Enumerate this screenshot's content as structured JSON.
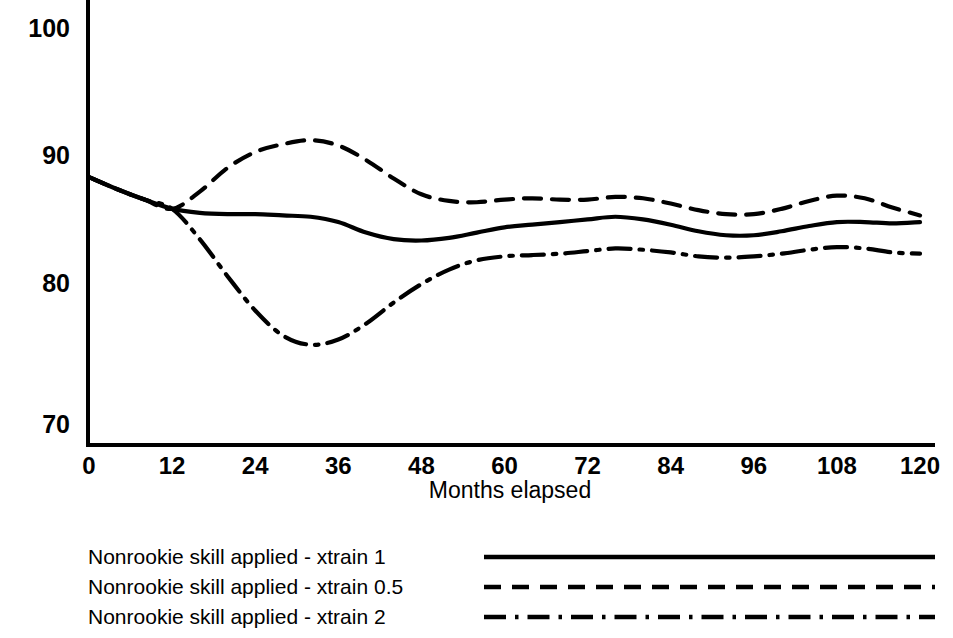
{
  "chart_data": {
    "type": "line",
    "title": "",
    "xlabel": "Months elapsed",
    "ylabel": "",
    "xlim": [
      0,
      120
    ],
    "ylim": [
      70,
      100
    ],
    "grid": false,
    "legend_position": "below",
    "x_ticks": [
      "0",
      "12",
      "24",
      "36",
      "48",
      "60",
      "72",
      "84",
      "96",
      "108",
      "120"
    ],
    "y_ticks": [
      "100",
      "90",
      "80",
      "70"
    ],
    "x": [
      0,
      4,
      8,
      12,
      16,
      20,
      24,
      28,
      32,
      36,
      40,
      44,
      48,
      52,
      56,
      60,
      64,
      68,
      72,
      76,
      80,
      84,
      88,
      92,
      96,
      100,
      104,
      108,
      112,
      116,
      120
    ],
    "series": [
      {
        "name": "Nonrookie skill applied - xtrain 1",
        "style": "solid",
        "values": [
          88.7,
          87.8,
          87.0,
          86.3,
          86.0,
          85.9,
          85.9,
          85.8,
          85.7,
          85.3,
          84.5,
          84.0,
          83.9,
          84.1,
          84.5,
          84.9,
          85.1,
          85.3,
          85.5,
          85.7,
          85.5,
          85.1,
          84.6,
          84.3,
          84.3,
          84.6,
          85.0,
          85.3,
          85.3,
          85.2,
          85.3
        ]
      },
      {
        "name": "Nonrookie skill applied - xtrain 0.5",
        "style": "dashed",
        "values": [
          88.7,
          87.8,
          87.0,
          86.3,
          87.6,
          89.4,
          90.6,
          91.2,
          91.5,
          91.1,
          90.0,
          88.6,
          87.4,
          86.9,
          86.8,
          87.0,
          87.1,
          87.0,
          87.0,
          87.2,
          87.1,
          86.7,
          86.2,
          85.9,
          85.9,
          86.3,
          86.9,
          87.3,
          87.1,
          86.4,
          85.8
        ]
      },
      {
        "name": "Nonrookie skill applied - xtrain 2",
        "style": "dashdot",
        "values": [
          88.7,
          87.8,
          87.0,
          86.3,
          84.0,
          81.2,
          78.6,
          76.7,
          76.0,
          76.4,
          77.6,
          79.2,
          80.6,
          81.7,
          82.4,
          82.7,
          82.8,
          82.9,
          83.1,
          83.3,
          83.2,
          83.0,
          82.7,
          82.6,
          82.7,
          82.9,
          83.2,
          83.4,
          83.3,
          83.0,
          82.9
        ]
      }
    ]
  },
  "axis": {
    "x_title": "Months elapsed"
  },
  "legend": {
    "items": [
      {
        "label": "Nonrookie skill applied - xtrain 1",
        "style": "solid"
      },
      {
        "label": "Nonrookie skill applied - xtrain 0.5",
        "style": "dashed"
      },
      {
        "label": "Nonrookie skill applied - xtrain 2",
        "style": "dashdot"
      }
    ]
  }
}
